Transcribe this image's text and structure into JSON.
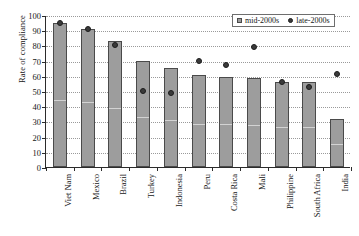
{
  "chart_data": {
    "type": "bar",
    "title": "",
    "xlabel": "",
    "ylabel": "Rate of compliance",
    "ylim": [
      0,
      100
    ],
    "ytick_step": 10,
    "yticks": [
      0,
      10,
      20,
      30,
      40,
      50,
      60,
      70,
      80,
      90,
      100
    ],
    "grid": true,
    "grid_axis": "y",
    "legend_position": "top-right",
    "categories": [
      "Viet Nam",
      "Mexico",
      "Brazil",
      "Turkey",
      "Indonesia",
      "Peru",
      "Costa Rica",
      "Mali",
      "Philippine",
      "South Africa",
      "India"
    ],
    "series": [
      {
        "name": "mid-2000s",
        "marker": "square",
        "render": "bar",
        "color": "#9d9d9d",
        "values": [
          95,
          91,
          83,
          69.5,
          65,
          60.5,
          59.5,
          58.5,
          56,
          56,
          31.5
        ]
      },
      {
        "name": "late-2000s",
        "marker": "circle",
        "render": "point",
        "color": "#3a3a3a",
        "values": [
          95,
          91,
          80,
          50,
          49,
          70,
          67,
          79,
          56,
          52.5,
          61
        ]
      }
    ]
  },
  "legend": {
    "items": [
      {
        "label": "mid-2000s",
        "marker": "square"
      },
      {
        "label": "late-2000s",
        "marker": "circle"
      }
    ]
  }
}
